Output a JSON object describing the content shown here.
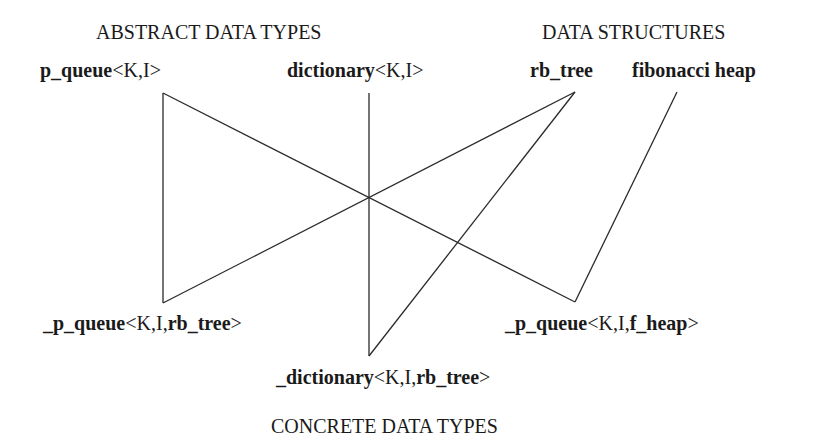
{
  "diagram": {
    "headings": {
      "abstract": "ABSTRACT DATA TYPES",
      "structures": "DATA STRUCTURES",
      "concrete": "CONCRETE DATA TYPES"
    },
    "nodes": {
      "p_queue": {
        "name": "p_queue",
        "params": "<K,I>"
      },
      "dictionary": {
        "name": "dictionary",
        "params": "<K,I>"
      },
      "rb_tree": {
        "name": "rb_tree"
      },
      "fibonacci_heap": {
        "name": "fibonacci heap"
      },
      "p_queue_rb": {
        "prefix": "_",
        "name": "p_queue",
        "params": "<K,I,",
        "impl": "rb_tree",
        "close": ">"
      },
      "dictionary_rb": {
        "prefix": "_",
        "name": "dictionary",
        "params": "<K,I,",
        "impl": "rb_tree",
        "close": ">"
      },
      "p_queue_fheap": {
        "prefix": "_",
        "name": "p_queue",
        "params": "<K,I,",
        "impl": "f_heap",
        "close": ">"
      }
    },
    "edges": [
      {
        "from": "p_queue",
        "to": "p_queue_rb"
      },
      {
        "from": "p_queue",
        "to": "p_queue_fheap"
      },
      {
        "from": "dictionary",
        "to": "dictionary_rb"
      },
      {
        "from": "rb_tree",
        "to": "p_queue_rb"
      },
      {
        "from": "rb_tree",
        "to": "dictionary_rb"
      },
      {
        "from": "fibonacci_heap",
        "to": "p_queue_fheap"
      }
    ],
    "colors": {
      "line": "#2a2a2a",
      "text": "#1a1a1a",
      "background": "#ffffff"
    }
  }
}
